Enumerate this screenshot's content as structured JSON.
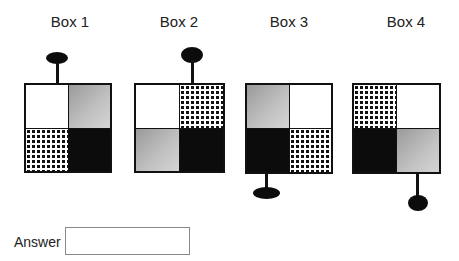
{
  "boxes": [
    {
      "title": "Box 1",
      "quadrants": [
        "white",
        "gray",
        "check",
        "black"
      ],
      "knob_position": "top-center"
    },
    {
      "title": "Box 2",
      "quadrants": [
        "white",
        "check",
        "gray",
        "black"
      ],
      "knob_position": "top-right"
    },
    {
      "title": "Box 3",
      "quadrants": [
        "gray",
        "white",
        "black",
        "check"
      ],
      "knob_position": "bottom-left"
    },
    {
      "title": "Box 4",
      "quadrants": [
        "check",
        "white",
        "black",
        "gray"
      ],
      "knob_position": "bottom-right"
    }
  ],
  "answer": {
    "label": "Answer",
    "value": "",
    "placeholder": ""
  }
}
